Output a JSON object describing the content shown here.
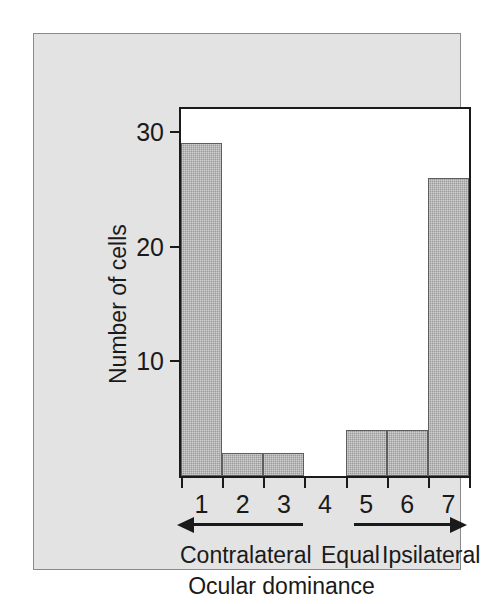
{
  "chart_data": {
    "type": "bar",
    "title": "",
    "subtitle": "",
    "xlabel": "Ocular dominance",
    "ylabel": "Number of cells",
    "categories": [
      "1",
      "2",
      "3",
      "4",
      "5",
      "6",
      "7"
    ],
    "values": [
      29,
      2,
      2,
      0,
      4,
      4,
      26
    ],
    "ylim": [
      0,
      32
    ],
    "yticks": [
      10,
      20,
      30
    ],
    "ytick_labels": [
      "10",
      "20",
      "30"
    ],
    "xlim": [
      0.5,
      7.5
    ],
    "grid": false,
    "legend": false,
    "bar_color": "#9a9a9a",
    "bar_edge_color": "#5e5e5e",
    "axis_color": "#1a1a1a",
    "panel_color": "#e3e3e3",
    "plot_background": "#ffffff",
    "annotations": [
      {
        "name": "left-arrow",
        "direction": "left",
        "label": "Contralateral"
      },
      {
        "name": "center-label",
        "direction": "none",
        "label": "Equal"
      },
      {
        "name": "right-arrow",
        "direction": "right",
        "label": "Ipsilateral"
      }
    ]
  },
  "axis": {
    "y_title": "Number of cells",
    "x_title": "Ocular dominance",
    "y_ticks": [
      {
        "value": 30,
        "label": "30"
      },
      {
        "value": 20,
        "label": "20"
      },
      {
        "value": 10,
        "label": "10"
      }
    ],
    "x_ticks": [
      {
        "value": 1,
        "label": "1"
      },
      {
        "value": 2,
        "label": "2"
      },
      {
        "value": 3,
        "label": "3"
      },
      {
        "value": 4,
        "label": "4"
      },
      {
        "value": 5,
        "label": "5"
      },
      {
        "value": 6,
        "label": "6"
      },
      {
        "value": 7,
        "label": "7"
      }
    ]
  },
  "captions": {
    "left": "Contralateral",
    "center": "Equal",
    "right": "Ipsilateral"
  }
}
